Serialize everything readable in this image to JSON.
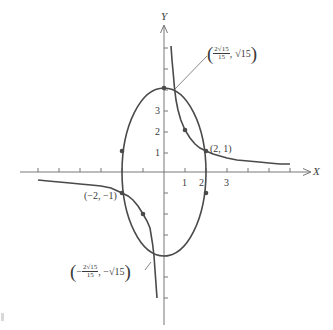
{
  "diagram": {
    "type": "function-graph",
    "colors": {
      "curve": "#4a4a4a",
      "axis": "#6a6a6a",
      "text": "#3a3a3a",
      "background": "#ffffff"
    },
    "axes": {
      "x_label": "X",
      "y_label": "Y",
      "x_tick_labels": [
        "1",
        "2",
        "3"
      ],
      "y_tick_labels": [
        "1",
        "2",
        "3"
      ],
      "x_range": [
        -6,
        6.8
      ],
      "y_range": [
        -6.8,
        7
      ]
    },
    "curves": [
      {
        "name": "ellipse",
        "equation": "x^2/4 + y^2/16 = 1"
      },
      {
        "name": "hyperbola",
        "equation": "xy = 2"
      }
    ],
    "marked_points": [
      {
        "x": 0,
        "y": 4
      },
      {
        "x": 1,
        "y": 2
      },
      {
        "x": 2,
        "y": 1
      },
      {
        "x": -2,
        "y": -1
      },
      {
        "x": -1,
        "y": -2
      },
      {
        "x": 2,
        "y": -1
      },
      {
        "x": -2,
        "y": 1
      }
    ],
    "annotations": {
      "top_intersection": {
        "open": "(",
        "frac_num": "2√15",
        "frac_den": "15",
        "sep": ",",
        "y_value": "√15",
        "close": ")"
      },
      "bottom_intersection": {
        "open": "(",
        "neg": "−",
        "frac_num": "2√15",
        "frac_den": "15",
        "sep": ", −",
        "y_value": "√15",
        "close": ")"
      },
      "point_2_1": "(2, 1)",
      "point_neg2_neg1": "(−2, −1)"
    }
  }
}
